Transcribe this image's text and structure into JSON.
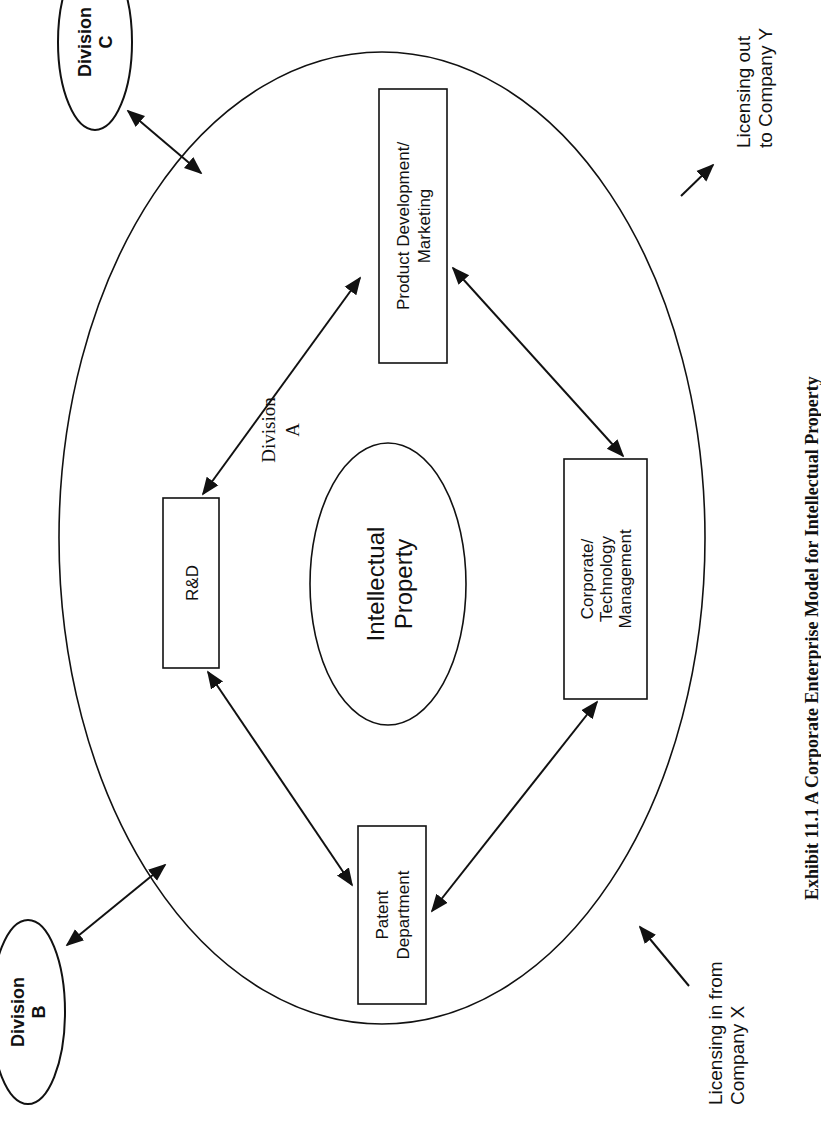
{
  "diagram": {
    "orientation": "rotated 90 degrees counterclockwise",
    "outer_ellipse": {
      "label_line1": "Division",
      "label_line2": "A"
    },
    "center": {
      "label_line1": "Intellectual",
      "label_line2": "Property"
    },
    "nodes": {
      "rd": {
        "label": "R&D"
      },
      "product": {
        "label_line1": "Product Development/",
        "label_line2": "Marketing"
      },
      "corporate": {
        "label_line1": "Corporate/",
        "label_line2": "Technology",
        "label_line3": "Management"
      },
      "patent": {
        "label_line1": "Patent",
        "label_line2": "Department"
      },
      "division_b": {
        "label_line1": "Division",
        "label_line2": "B"
      },
      "division_c": {
        "label_line1": "Division",
        "label_line2": "C"
      }
    },
    "external": {
      "licensing_in": {
        "label_line1": "Licensing in from",
        "label_line2": "Company X"
      },
      "licensing_out": {
        "label_line1": "Licensing out",
        "label_line2": "to Company Y"
      }
    },
    "edges": [
      {
        "from": "R&D",
        "to": "Product Development/Marketing",
        "type": "bidirectional"
      },
      {
        "from": "Product Development/Marketing",
        "to": "Corporate/Technology Management",
        "type": "bidirectional"
      },
      {
        "from": "Corporate/Technology Management",
        "to": "Patent Department",
        "type": "bidirectional"
      },
      {
        "from": "Patent Department",
        "to": "R&D",
        "type": "bidirectional"
      },
      {
        "from": "Division C",
        "to": "Division A",
        "type": "bidirectional"
      },
      {
        "from": "Division B",
        "to": "Division A",
        "type": "bidirectional"
      },
      {
        "from": "Company X",
        "to": "Division A",
        "type": "inbound"
      },
      {
        "from": "Division A",
        "to": "Company Y",
        "type": "outbound"
      }
    ],
    "caption": "Exhibit 11.1 A Corporate Enterprise Model for Intellectual Property"
  }
}
